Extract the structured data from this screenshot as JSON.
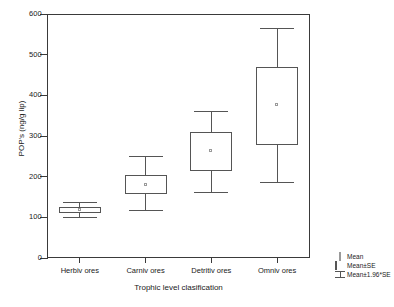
{
  "chart_data": {
    "type": "box",
    "title": "",
    "xlabel": "Trophic level clasification",
    "ylabel": "POP's (ng/g lip)",
    "categories": [
      "Herbiv ores",
      "Carniv ores",
      "Detritiv ores",
      "Omniv ores"
    ],
    "ylim": [
      0,
      600
    ],
    "y_ticks": [
      0,
      100,
      200,
      300,
      400,
      500,
      600
    ],
    "y_tick_labels": [
      "0",
      "100",
      "200",
      "300",
      "400",
      "500",
      "600"
    ],
    "grid": false,
    "legend_position": "bottom-right",
    "series": [
      {
        "name": "Herbiv ores",
        "mean": 118,
        "box_low": 110,
        "box_high": 125,
        "whisker_low": 100,
        "whisker_high": 138
      },
      {
        "name": "Carniv ores",
        "mean": 180,
        "box_low": 158,
        "box_high": 203,
        "whisker_low": 118,
        "whisker_high": 252
      },
      {
        "name": "Detritiv ores",
        "mean": 263,
        "box_low": 213,
        "box_high": 310,
        "whisker_low": 163,
        "whisker_high": 362
      },
      {
        "name": "Omniv ores",
        "mean": 377,
        "box_low": 278,
        "box_high": 470,
        "whisker_low": 188,
        "whisker_high": 565
      }
    ],
    "legend": [
      {
        "label": "Mean",
        "symbol": "mean-marker-icon"
      },
      {
        "label": "Mean±SE",
        "symbol": "box-icon"
      },
      {
        "label": "Mean±1.96*SE",
        "symbol": "whisker-icon"
      }
    ]
  }
}
